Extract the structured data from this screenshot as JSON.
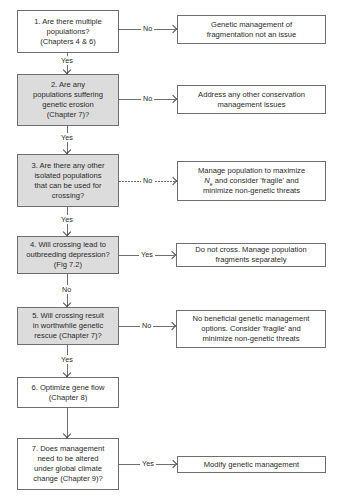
{
  "diagram": {
    "type": "flowchart",
    "decisions": [
      {
        "id": 1,
        "text": "1. Are there multiple\npopulations?\n(Chapters 4 & 6)",
        "shaded": false
      },
      {
        "id": 2,
        "text": "2. Are any\npopulations suffering\ngenetic erosion\n(Chapter 7)?",
        "shaded": true
      },
      {
        "id": 3,
        "text": "3. Are there any other\nisolated populations\nthat can be used for\ncrossing?",
        "shaded": true
      },
      {
        "id": 4,
        "text": "4. Will crossing lead to\noutbreeding depression?\n(Fig 7.2)",
        "shaded": true
      },
      {
        "id": 5,
        "text": "5. Will crossing result\nin worthwhile genetic\nrescue (Chapter 7)?",
        "shaded": true
      },
      {
        "id": 6,
        "text": "6. Optimize gene flow\n(Chapter 8)",
        "shaded": false
      },
      {
        "id": 7,
        "text": "7. Does management\nneed to be altered\nunder global climate\nchange (Chapter 9)?",
        "shaded": false
      }
    ],
    "outcomes": [
      {
        "from": 1,
        "branch": "No",
        "text": "Genetic management of\nfragmentation not an issue"
      },
      {
        "from": 2,
        "branch": "No",
        "text": "Address any other conservation\nmanagement issues"
      },
      {
        "from": 3,
        "branch": "No",
        "text_line1": "Manage population to maximize",
        "text_ne_N": "N",
        "text_ne_sub": "e",
        "text_line2_rest": " and consider 'fragile' and",
        "text_line3": "minimize non-genetic threats"
      },
      {
        "from": 4,
        "branch": "Yes",
        "text": "Do not cross. Manage population\nfragments separately"
      },
      {
        "from": 5,
        "branch": "No",
        "text": "No beneficial genetic management\noptions. Consider 'fragile' and\nminimize non-genetic threats"
      },
      {
        "from": 7,
        "branch": "Yes",
        "text": "Modify genetic management"
      }
    ],
    "vertical_links": [
      {
        "from": 1,
        "to": 2,
        "label": "Yes"
      },
      {
        "from": 2,
        "to": 3,
        "label": "Yes"
      },
      {
        "from": 3,
        "to": 4,
        "label": "Yes"
      },
      {
        "from": 4,
        "to": 5,
        "label": "No"
      },
      {
        "from": 5,
        "to": 6,
        "label": "Yes"
      },
      {
        "from": 6,
        "to": 7,
        "label": ""
      }
    ],
    "colors": {
      "shaded_fill": "#dcdcdc",
      "border": "#6e6e6e",
      "text": "#2a2a2a"
    }
  }
}
